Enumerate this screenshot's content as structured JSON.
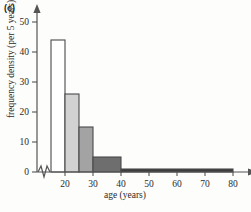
{
  "figure": {
    "panel_label": "(c)",
    "background_color": "#fdfdfc",
    "axis_color": "#555555"
  },
  "chart_data": {
    "type": "bar",
    "title": "",
    "subtitle": "",
    "xlabel": "age (years)",
    "ylabel": "frequency density (per 5 years)",
    "xlim": [
      15,
      80
    ],
    "ylim": [
      0,
      52
    ],
    "x_ticks": [
      20,
      30,
      40,
      50,
      60,
      70,
      80
    ],
    "x_tick_labels": [
      "20",
      "30",
      "40",
      "50",
      "60",
      "70",
      "80"
    ],
    "y_ticks": [
      0,
      10,
      20,
      30,
      40,
      50
    ],
    "y_tick_labels": [
      "0",
      "10",
      "20",
      "30",
      "40",
      "50"
    ],
    "grid": false,
    "legend": "none",
    "axis_break": "x-axis broken between 0 and 15",
    "bin_edges": [
      15,
      20,
      25,
      30,
      35,
      40,
      80
    ],
    "categories": [
      "15-20",
      "20-25",
      "25-30",
      "30-40",
      "40-80"
    ],
    "bins": [
      {
        "label": "15-20",
        "start": 15,
        "end": 20,
        "value": 44,
        "fill": "#ffffff"
      },
      {
        "label": "20-25",
        "start": 20,
        "end": 25,
        "value": 26,
        "fill": "#d2d2d2"
      },
      {
        "label": "25-30",
        "start": 25,
        "end": 30,
        "value": 15,
        "fill": "#a3a3a3"
      },
      {
        "label": "30-40",
        "start": 30,
        "end": 40,
        "value": 5,
        "fill": "#6e6e6e"
      },
      {
        "label": "40-80",
        "start": 40,
        "end": 80,
        "value": 1,
        "fill": "#3d3d3d"
      }
    ],
    "values": [
      44,
      26,
      15,
      5,
      1
    ]
  }
}
